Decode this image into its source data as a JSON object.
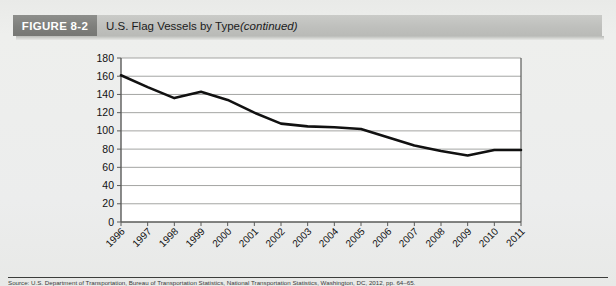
{
  "figure": {
    "number_label": "FIGURE 8-2",
    "title_main": "U.S. Flag Vessels by Type ",
    "title_italic": "(continued)"
  },
  "source": {
    "text": "Source: U.S. Department of Transportation, Bureau of Transportation Statistics, National Transportation Statistics, Washington, DC, 2012, pp. 64–65."
  },
  "colors": {
    "banner_number_bg": "#7e7f7c",
    "banner_title_bg": "#bfc0bd",
    "page_bg": "#eceded",
    "plot_bg": "#ffffff",
    "gridline": "#9a9b99",
    "axis": "#5a5b59",
    "series_line": "#111111"
  },
  "chart_data": {
    "type": "line",
    "title": "",
    "xlabel": "",
    "ylabel": "",
    "ylim": [
      0,
      180
    ],
    "ytick_step": 20,
    "yticks": [
      "0",
      "20",
      "40",
      "60",
      "80",
      "100",
      "120",
      "140",
      "160",
      "180"
    ],
    "grid": true,
    "legend": "none",
    "categories": [
      "1996",
      "1997",
      "1998",
      "1999",
      "2000",
      "2001",
      "2002",
      "2003",
      "2004",
      "2005",
      "2006",
      "2007",
      "2008",
      "2009",
      "2010",
      "2011"
    ],
    "series": [
      {
        "name": "U.S. Flag Vessels",
        "values": [
          161,
          148,
          136,
          143,
          134,
          120,
          108,
          105,
          104,
          102,
          93,
          84,
          78,
          73,
          79,
          79
        ]
      }
    ]
  }
}
